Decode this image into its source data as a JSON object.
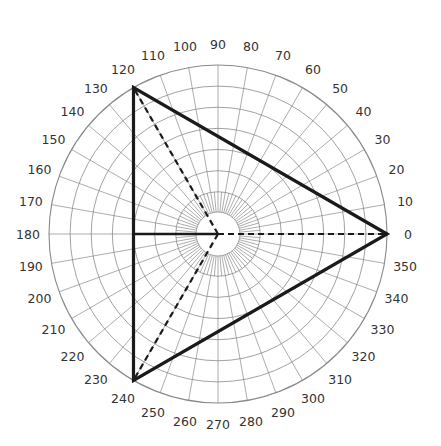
{
  "diagram": {
    "type": "polar-grid",
    "center": [
      218,
      234
    ],
    "outer_radius": 169,
    "ring_count": 8,
    "inner_circle_radius": 22,
    "label_radius": 190,
    "grid_color": "#8a8a8a",
    "line_color": "#1a1a1a",
    "angle_labels": [
      "0",
      "10",
      "20",
      "30",
      "40",
      "50",
      "60",
      "70",
      "80",
      "90",
      "100",
      "110",
      "120",
      "130",
      "140",
      "150",
      "160",
      "170",
      "180",
      "190",
      "200",
      "210",
      "220",
      "230",
      "240",
      "250",
      "260",
      "270",
      "280",
      "290",
      "300",
      "310",
      "320",
      "330",
      "340",
      "350"
    ],
    "triangle": {
      "vertices_deg": [
        0,
        120,
        240
      ],
      "style": "solid"
    },
    "spokes": {
      "angles_deg": [
        0,
        120,
        240
      ],
      "style": "dashed",
      "note": "dashed lines from center to each vertex"
    },
    "diameter_line": {
      "from_deg": 180,
      "to_center": true,
      "style": "solid"
    }
  }
}
